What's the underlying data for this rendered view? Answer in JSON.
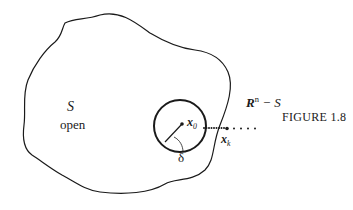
{
  "figure": {
    "caption": "FIGURE 1.8",
    "set_label": "S",
    "set_description": "open",
    "complement_label_base": "R",
    "complement_label_sup": "n",
    "complement_label_rest": " − S",
    "center_point_base": "x",
    "center_point_sub": "0",
    "radius_label": "δ",
    "sequence_point_base": "x",
    "sequence_point_sub": "k"
  },
  "colors": {
    "ink": "#1a1a1a",
    "background": "#ffffff"
  }
}
